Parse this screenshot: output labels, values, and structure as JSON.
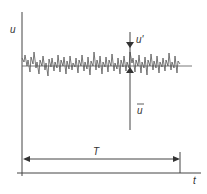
{
  "diagram": {
    "title": "",
    "labels": {
      "y_axis": "u",
      "x_axis": "t",
      "fluctuation": "u'",
      "mean": "u",
      "period": "T"
    },
    "colors": {
      "line": "#444444",
      "signal": "#555555",
      "background": "#ffffff"
    },
    "elements": [
      "vertical axis u",
      "horizontal axis t",
      "fluctuating signal around mean",
      "mean level line",
      "fluctuation marker u'",
      "mean marker u-bar",
      "averaging period arrow T"
    ]
  }
}
